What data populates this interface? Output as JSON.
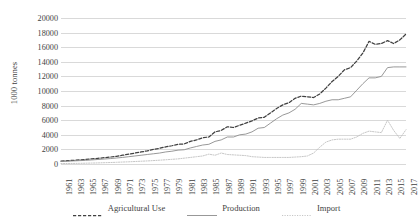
{
  "chart_data": {
    "type": "line",
    "title": "",
    "subtitle": "",
    "xlabel": "",
    "ylabel": "1000 tonnes",
    "ylim": [
      0,
      20000
    ],
    "ytick_step": 2000,
    "yticks": [
      20000,
      18000,
      16000,
      14000,
      12000,
      10000,
      8000,
      6000,
      4000,
      2000,
      0
    ],
    "ytick_labels": [
      "20000",
      "18000",
      "16000",
      "14000",
      "12000",
      "10000",
      "8000",
      "6000",
      "4000",
      "2000",
      "0"
    ],
    "grid": true,
    "grid_axis": "y",
    "legend_position": "bottom",
    "xlim": [
      1961,
      2017
    ],
    "xtick_labels": [
      "1961",
      "1963",
      "1965",
      "1967",
      "1969",
      "1971",
      "1973",
      "1975",
      "1977",
      "1979",
      "1981",
      "1983",
      "1985",
      "1987",
      "1989",
      "1991",
      "1993",
      "1995",
      "1997",
      "1999",
      "2001",
      "2003",
      "2005",
      "2007",
      "2009",
      "2011",
      "2013",
      "2015",
      "2017"
    ],
    "x": [
      1961,
      1962,
      1963,
      1964,
      1965,
      1966,
      1967,
      1968,
      1969,
      1970,
      1971,
      1972,
      1973,
      1974,
      1975,
      1976,
      1977,
      1978,
      1979,
      1980,
      1981,
      1982,
      1983,
      1984,
      1985,
      1986,
      1987,
      1988,
      1989,
      1990,
      1991,
      1992,
      1993,
      1994,
      1995,
      1996,
      1997,
      1998,
      1999,
      2000,
      2001,
      2002,
      2003,
      2004,
      2005,
      2006,
      2007,
      2008,
      2009,
      2010,
      2011,
      2012,
      2013,
      2014,
      2015,
      2016,
      2017
    ],
    "series": [
      {
        "name": "Agricultural Use",
        "style": "dashed",
        "color": "#404040",
        "values": [
          400,
          450,
          500,
          560,
          620,
          700,
          780,
          860,
          950,
          1050,
          1200,
          1350,
          1500,
          1650,
          1800,
          2000,
          2150,
          2350,
          2500,
          2700,
          2750,
          3100,
          3300,
          3600,
          3700,
          4400,
          4600,
          5100,
          5000,
          5300,
          5600,
          5900,
          6300,
          6400,
          7000,
          7600,
          8100,
          8400,
          9000,
          9300,
          9200,
          9100,
          9600,
          10400,
          11300,
          12000,
          12900,
          13200,
          14100,
          15200,
          16800,
          16400,
          16500,
          16900,
          16500,
          17000,
          17800
        ]
      },
      {
        "name": "Production",
        "style": "solid",
        "color": "#8c8c8c",
        "values": [
          350,
          380,
          420,
          460,
          500,
          560,
          620,
          680,
          740,
          820,
          900,
          1000,
          1100,
          1200,
          1300,
          1400,
          1500,
          1650,
          1750,
          1900,
          1950,
          2200,
          2400,
          2600,
          2700,
          3100,
          3300,
          3700,
          3700,
          4000,
          4100,
          4400,
          4900,
          5000,
          5600,
          6200,
          6700,
          7000,
          7500,
          8300,
          8200,
          8100,
          8300,
          8600,
          8800,
          8800,
          9000,
          9200,
          10100,
          11000,
          11800,
          11800,
          12000,
          13200,
          13300,
          13300,
          13300
        ]
      },
      {
        "name": "Import",
        "style": "dotted",
        "color": "#bfbfbf",
        "values": [
          60,
          70,
          80,
          90,
          110,
          130,
          150,
          180,
          200,
          230,
          270,
          300,
          340,
          380,
          420,
          470,
          520,
          580,
          640,
          700,
          800,
          900,
          1000,
          1100,
          1350,
          1200,
          1500,
          1300,
          1250,
          1200,
          1150,
          1000,
          950,
          900,
          900,
          900,
          900,
          900,
          950,
          1000,
          1100,
          1500,
          2300,
          3000,
          3300,
          3400,
          3400,
          3400,
          3700,
          4200,
          4500,
          4400,
          4300,
          6000,
          4600,
          3500,
          4700
        ]
      }
    ]
  }
}
